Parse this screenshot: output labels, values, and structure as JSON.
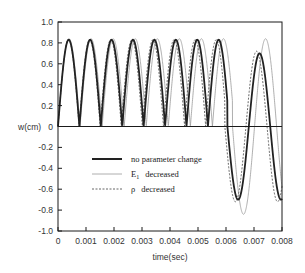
{
  "chart_data": {
    "type": "line",
    "title": "",
    "xlabel": "time(sec)",
    "ylabel": "w(cm)",
    "xlim": [
      0,
      0.008
    ],
    "ylim": [
      -1.0,
      1.0
    ],
    "xticks": [
      "0",
      "0.001",
      "0.002",
      "0.003",
      "0.004",
      "0.005",
      "0.006",
      "0.007",
      "0.008"
    ],
    "yticks": [
      "1.0",
      "0.8",
      "0.6",
      "0.4",
      "0.2",
      "0",
      "-0.2",
      "-0.4",
      "-0.6",
      "-0.8",
      "-1.0"
    ],
    "grid": false,
    "zero_line": true,
    "legend_position": "inside lower-left",
    "period_sec": 0.000765,
    "switch_time_sec": 0.00605,
    "series": [
      {
        "name": "no parameter change",
        "style": "solid-thick",
        "phase1_amplitude": 0.83,
        "phase2_amplitude": 0.7,
        "period_scale": 1.0,
        "peaks": [
          [
            0.00043,
            0.83
          ],
          [
            0.00119,
            0.83
          ],
          [
            0.00196,
            0.83
          ],
          [
            0.00273,
            0.83
          ],
          [
            0.00349,
            0.83
          ],
          [
            0.00426,
            0.83
          ],
          [
            0.00502,
            0.83
          ],
          [
            0.00579,
            0.83
          ],
          [
            0.00665,
            0.7
          ],
          [
            0.00743,
            0.7
          ]
        ],
        "minima_after_switch": [
          [
            0.0063,
            -0.7
          ],
          [
            0.00705,
            -0.7
          ],
          [
            0.00782,
            -0.7
          ]
        ]
      },
      {
        "name": "E1 decreased",
        "name_main": "E",
        "name_sub": "1",
        "name_rest": "decreased",
        "style": "solid-thin",
        "phase1_amplitude": 0.84,
        "phase2_amplitude": 0.84,
        "period_scale": 1.03,
        "peaks": [
          [
            0.00044,
            0.84
          ],
          [
            0.00123,
            0.84
          ],
          [
            0.00202,
            0.84
          ],
          [
            0.00281,
            0.84
          ],
          [
            0.0036,
            0.84
          ],
          [
            0.0044,
            0.84
          ],
          [
            0.00519,
            0.84
          ],
          [
            0.00598,
            0.84
          ],
          [
            0.00675,
            0.84
          ],
          [
            0.00752,
            0.84
          ]
        ],
        "minima_after_switch": [
          [
            0.00635,
            -0.84
          ],
          [
            0.00712,
            -0.84
          ],
          [
            0.0079,
            -0.84
          ]
        ]
      },
      {
        "name": "ρ decreased",
        "name_main": "ρ",
        "name_rest": "decreased",
        "style": "dashed",
        "phase1_amplitude": 0.83,
        "phase2_amplitude": 0.72,
        "period_scale": 0.985,
        "peaks": [
          [
            0.00042,
            0.83
          ],
          [
            0.00117,
            0.83
          ],
          [
            0.00193,
            0.83
          ],
          [
            0.00268,
            0.83
          ],
          [
            0.00344,
            0.83
          ],
          [
            0.00419,
            0.83
          ],
          [
            0.00494,
            0.83
          ],
          [
            0.0057,
            0.83
          ],
          [
            0.0066,
            0.72
          ],
          [
            0.00738,
            0.72
          ]
        ],
        "minima_after_switch": [
          [
            0.00625,
            -0.72
          ],
          [
            0.007,
            -0.72
          ],
          [
            0.00778,
            -0.72
          ]
        ]
      }
    ]
  },
  "layout": {
    "plot_left": 58,
    "plot_right": 282,
    "plot_top": 22,
    "plot_bottom": 231
  },
  "colors": {
    "axis": "#1a1a1a",
    "thick_line": "#222222",
    "thin_line": "#9a9a9a",
    "dashed_line": "#555555",
    "text": "#333333"
  }
}
